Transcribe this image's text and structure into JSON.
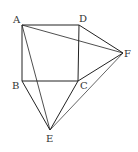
{
  "figure": {
    "points": {
      "A": {
        "label": "A",
        "x": 22,
        "y": 25,
        "lx": 13,
        "ly": 23
      },
      "D": {
        "label": "D",
        "x": 79,
        "y": 25,
        "lx": 79,
        "ly": 22
      },
      "B": {
        "label": "B",
        "x": 22,
        "y": 81,
        "lx": 12,
        "ly": 89
      },
      "C": {
        "label": "C",
        "x": 78,
        "y": 81,
        "lx": 80,
        "ly": 89
      },
      "E": {
        "label": "E",
        "x": 50,
        "y": 130,
        "lx": 46,
        "ly": 142
      },
      "F": {
        "label": "F",
        "x": 123,
        "y": 53,
        "lx": 124,
        "ly": 57
      }
    },
    "segments": [
      [
        "A",
        "D"
      ],
      [
        "D",
        "C"
      ],
      [
        "C",
        "B"
      ],
      [
        "B",
        "A"
      ],
      [
        "B",
        "E"
      ],
      [
        "C",
        "E"
      ],
      [
        "D",
        "F"
      ],
      [
        "C",
        "F"
      ],
      [
        "A",
        "E"
      ],
      [
        "A",
        "F"
      ],
      [
        "E",
        "F"
      ]
    ],
    "stroke_color": "#222222"
  }
}
